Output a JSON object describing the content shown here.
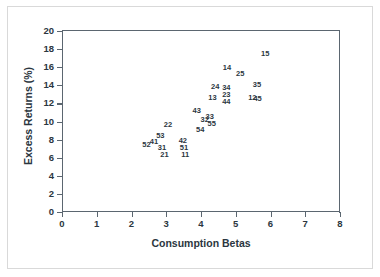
{
  "figure": {
    "x_axis_title": "Consumption Betas",
    "y_axis_title": "Excess Returns (%)"
  },
  "axis": {
    "x_ticks": [
      "0",
      "1",
      "2",
      "3",
      "4",
      "5",
      "6",
      "7",
      "8"
    ],
    "y_ticks": [
      "0",
      "2",
      "4",
      "6",
      "8",
      "10",
      "12",
      "14",
      "16",
      "18",
      "20"
    ]
  },
  "chart_data": {
    "type": "scatter",
    "title": "",
    "xlabel": "Consumption Betas",
    "ylabel": "Excess Returns (%)",
    "xlim": [
      0,
      8
    ],
    "ylim": [
      0,
      20
    ],
    "xticks": [
      0,
      1,
      2,
      3,
      4,
      5,
      6,
      7,
      8
    ],
    "yticks": [
      0,
      2,
      4,
      6,
      8,
      10,
      12,
      14,
      16,
      18,
      20
    ],
    "grid": false,
    "legend": "none",
    "marker_style": "text-label",
    "note": "Each data point is rendered as its numeric portfolio label rather than a marker glyph.",
    "points": [
      {
        "label": "52",
        "x": 2.4,
        "y": 7.45
      },
      {
        "label": "41",
        "x": 2.62,
        "y": 7.75
      },
      {
        "label": "53",
        "x": 2.8,
        "y": 8.45
      },
      {
        "label": "31",
        "x": 2.85,
        "y": 7.05
      },
      {
        "label": "21",
        "x": 2.92,
        "y": 6.25
      },
      {
        "label": "22",
        "x": 3.02,
        "y": 9.65
      },
      {
        "label": "42",
        "x": 3.45,
        "y": 7.8
      },
      {
        "label": "51",
        "x": 3.48,
        "y": 7.05
      },
      {
        "label": "11",
        "x": 3.52,
        "y": 6.25
      },
      {
        "label": "43",
        "x": 3.85,
        "y": 11.2
      },
      {
        "label": "54",
        "x": 3.95,
        "y": 9.05
      },
      {
        "label": "32",
        "x": 4.08,
        "y": 10.15
      },
      {
        "label": "33",
        "x": 4.22,
        "y": 10.45
      },
      {
        "label": "55",
        "x": 4.28,
        "y": 9.75
      },
      {
        "label": "13",
        "x": 4.3,
        "y": 12.55
      },
      {
        "label": "24",
        "x": 4.38,
        "y": 13.85
      },
      {
        "label": "34",
        "x": 4.7,
        "y": 13.75
      },
      {
        "label": "23",
        "x": 4.7,
        "y": 12.95
      },
      {
        "label": "44",
        "x": 4.7,
        "y": 12.2
      },
      {
        "label": "14",
        "x": 4.72,
        "y": 15.9
      },
      {
        "label": "25",
        "x": 5.1,
        "y": 15.3
      },
      {
        "label": "12",
        "x": 5.45,
        "y": 12.65
      },
      {
        "label": "45",
        "x": 5.6,
        "y": 12.5
      },
      {
        "label": "35",
        "x": 5.58,
        "y": 14.0
      },
      {
        "label": "15",
        "x": 5.82,
        "y": 17.5
      }
    ]
  }
}
